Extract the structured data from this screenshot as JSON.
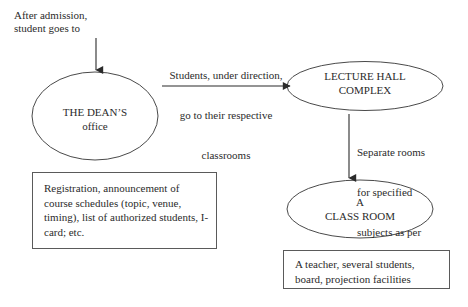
{
  "diagram": {
    "background_color": "#ffffff",
    "stroke_color": "#4a4a4a",
    "text_color": "#2b2b2b",
    "captions": {
      "admission": "After admission,\nstudent goes to",
      "classrooms_line1": "Students, under direction,",
      "classrooms_line2": "go to their respective",
      "classrooms_line3": "classrooms",
      "separate_rooms_line1": "Separate rooms",
      "separate_rooms_line2": "for specified",
      "separate_rooms_line3": "subjects as per",
      "separate_rooms_line4": "schedule"
    },
    "nodes": {
      "deans_office": {
        "shape": "ellipse",
        "line1": "THE DEAN’S",
        "line2": "office"
      },
      "lecture_hall_complex": {
        "shape": "ellipse",
        "line1": "LECTURE HALL",
        "line2": "COMPLEX"
      },
      "class_room": {
        "shape": "ellipse",
        "line1": "A",
        "line2": "CLASS ROOM"
      },
      "registration_note": {
        "shape": "rectangle",
        "text": "Registration, announcement of course schedules (topic, venue, timing), list of authorized students, I-card; etc."
      },
      "classroom_contents_note": {
        "shape": "rectangle",
        "text": "A teacher, several students, board, projection facilities"
      }
    },
    "connectors": [
      {
        "name": "arrow-admission-to-deans-office",
        "direction": "down",
        "label": "After admission, student goes to"
      },
      {
        "name": "arrow-deans-office-to-lecture-hall",
        "direction": "right",
        "label": "Students, under direction, go to their respective classrooms"
      },
      {
        "name": "arrow-lecture-hall-to-class-room",
        "direction": "down",
        "label": "Separate rooms for specified subjects as per schedule"
      }
    ]
  }
}
